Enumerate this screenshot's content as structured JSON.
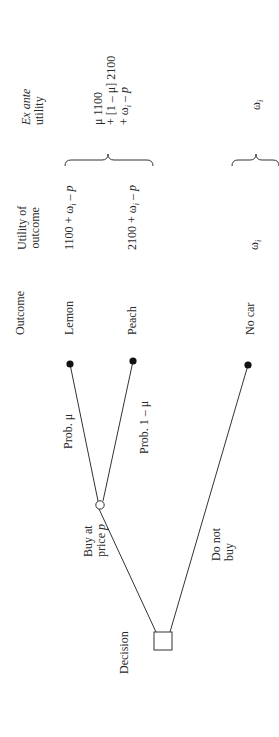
{
  "diagram": {
    "type": "decision-tree",
    "orientation": "rotated-90-ccw",
    "headers": {
      "outcome": "Outcome",
      "utility_line1": "Utility of",
      "utility_line2": "outcome",
      "exante_line1": "Ex ante",
      "exante_line2": "utility"
    },
    "decision_node": {
      "label": "Decision"
    },
    "branches": {
      "buy": {
        "line1": "Buy at",
        "line2_prefix": "price ",
        "line2_var": "p"
      },
      "not_buy": {
        "line1": "Do not",
        "line2": "buy"
      }
    },
    "chance_branches": {
      "lemon_prob": "Prob. μ",
      "peach_prob": "Prob. 1 – μ"
    },
    "outcomes": [
      {
        "name": "Lemon",
        "utility": "1100 + ωᵢ – p"
      },
      {
        "name": "Peach",
        "utility": "2100 + ωᵢ – p"
      },
      {
        "name": "No car",
        "utility": "ωᵢ"
      }
    ],
    "utilities": {
      "lemon_prefix": "1100 + ω",
      "peach_prefix": "2100 + ω",
      "sub_i": "i",
      "minus": " – ",
      "p": "p",
      "nocar_omega": "ω"
    },
    "exante": {
      "buy_line1": "μ 1100",
      "buy_line2": "+ [1 – μ] 2100",
      "buy_line3_prefix": "+ ω",
      "buy_line3_sub": "i",
      "buy_line3_suffix": " – ",
      "buy_line3_p": "p",
      "nobuy_omega": "ω",
      "nobuy_sub": "i"
    }
  }
}
